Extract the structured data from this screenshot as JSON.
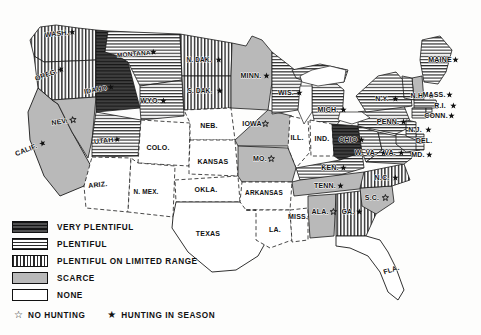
{
  "map": {
    "title": "United States game distribution map",
    "states": [
      {
        "code": "WASH",
        "label": "WASH.",
        "fill": "limited",
        "star": "season",
        "x": 57,
        "y": 36,
        "rot": -6
      },
      {
        "code": "OREG",
        "label": "OREG.",
        "fill": "limited",
        "star": "season",
        "x": 47,
        "y": 77,
        "rot": -20
      },
      {
        "code": "IDAHO",
        "label": "IDAHO",
        "fill": "very",
        "star": "season",
        "x": 96,
        "y": 92,
        "rot": -10
      },
      {
        "code": "MONT",
        "label": "MONTANA",
        "fill": "plentiful",
        "star": "season",
        "x": 134,
        "y": 56,
        "rot": -5
      },
      {
        "code": "WYO",
        "label": "WYO.",
        "fill": "plentiful",
        "star": "season",
        "x": 150,
        "y": 103,
        "rot": 0
      },
      {
        "code": "NDAK",
        "label": "N. DAK.",
        "fill": "limited",
        "star": "season",
        "x": 199,
        "y": 62,
        "rot": 0
      },
      {
        "code": "SDAK",
        "label": "S. DAK.",
        "fill": "limited",
        "star": "season",
        "x": 200,
        "y": 93,
        "rot": 0
      },
      {
        "code": "MINN",
        "label": "MINN.",
        "fill": "scarce",
        "star": "season",
        "x": 251,
        "y": 78,
        "rot": 0
      },
      {
        "code": "WIS",
        "label": "WIS.",
        "fill": "plentiful",
        "star": "season",
        "x": 286,
        "y": 95,
        "rot": 0
      },
      {
        "code": "MICH",
        "label": "MICH.",
        "fill": "plentiful",
        "star": "season",
        "x": 328,
        "y": 112,
        "rot": 0
      },
      {
        "code": "IOWA",
        "label": "IOWA",
        "fill": "scarce",
        "star": "none",
        "x": 252,
        "y": 126,
        "rot": 0
      },
      {
        "code": "NEB",
        "label": "NEB.",
        "fill": "none",
        "star": "",
        "x": 209,
        "y": 128,
        "rot": 0
      },
      {
        "code": "NEV",
        "label": "NEV.",
        "fill": "scarce",
        "star": "none",
        "x": 60,
        "y": 124,
        "rot": -8
      },
      {
        "code": "CALIF",
        "label": "CALIF.",
        "fill": "scarce",
        "star": "season",
        "x": 27,
        "y": 152,
        "rot": -22
      },
      {
        "code": "UTAH",
        "label": "UTAH",
        "fill": "plentiful",
        "star": "season",
        "x": 104,
        "y": 143,
        "rot": -6
      },
      {
        "code": "COLO",
        "label": "COLO.",
        "fill": "none",
        "star": "",
        "x": 158,
        "y": 150,
        "rot": 0
      },
      {
        "code": "KANSAS",
        "label": "KANSAS",
        "fill": "none",
        "star": "",
        "x": 213,
        "y": 164,
        "rot": 0
      },
      {
        "code": "ARIZ",
        "label": "ARIZ.",
        "fill": "none",
        "star": "",
        "x": 98,
        "y": 187,
        "rot": -6
      },
      {
        "code": "NMEX",
        "label": "N. MEX.",
        "fill": "none",
        "star": "",
        "x": 146,
        "y": 194,
        "rot": 0
      },
      {
        "code": "OKLA",
        "label": "OKLA.",
        "fill": "none",
        "star": "",
        "x": 206,
        "y": 192,
        "rot": 0
      },
      {
        "code": "TEXAS",
        "label": "TEXAS",
        "fill": "none",
        "star": "",
        "x": 208,
        "y": 236,
        "rot": 0
      },
      {
        "code": "MO",
        "label": "MO.",
        "fill": "scarce",
        "star": "none",
        "x": 260,
        "y": 161,
        "rot": 0
      },
      {
        "code": "ARK",
        "label": "ARKANSAS",
        "fill": "none",
        "star": "",
        "x": 264,
        "y": 195,
        "rot": 0
      },
      {
        "code": "LA",
        "label": "LA.",
        "fill": "none",
        "star": "",
        "x": 275,
        "y": 232,
        "rot": 0
      },
      {
        "code": "MISS",
        "label": "MISS.",
        "fill": "none",
        "star": "",
        "x": 298,
        "y": 219,
        "rot": 0
      },
      {
        "code": "ILL",
        "label": "ILL.",
        "fill": "none",
        "star": "",
        "x": 297,
        "y": 140,
        "rot": 0
      },
      {
        "code": "IND",
        "label": "IND.",
        "fill": "none",
        "star": "",
        "x": 322,
        "y": 141,
        "rot": 0
      },
      {
        "code": "OHIO",
        "label": "OHIO",
        "fill": "very",
        "star": "season",
        "x": 348,
        "y": 142,
        "rot": 0
      },
      {
        "code": "KEN",
        "label": "KEN.",
        "fill": "plentiful",
        "star": "season",
        "x": 330,
        "y": 170,
        "rot": 0
      },
      {
        "code": "TENN",
        "label": "TENN.",
        "fill": "scarce",
        "star": "season",
        "x": 325,
        "y": 188,
        "rot": 0
      },
      {
        "code": "ALA",
        "label": "ALA.",
        "fill": "scarce",
        "star": "none",
        "x": 320,
        "y": 214,
        "rot": 0
      },
      {
        "code": "GA",
        "label": "GA.",
        "fill": "limited",
        "star": "season",
        "x": 348,
        "y": 214,
        "rot": 0
      },
      {
        "code": "SC",
        "label": "S.C.",
        "fill": "scarce",
        "star": "none",
        "x": 372,
        "y": 200,
        "rot": 0
      },
      {
        "code": "NC",
        "label": "N.C.",
        "fill": "limited",
        "star": "season",
        "x": 382,
        "y": 180,
        "rot": 0
      },
      {
        "code": "WVA",
        "label": "W. VA.",
        "fill": "plentiful",
        "star": "season",
        "x": 366,
        "y": 155,
        "rot": 0
      },
      {
        "code": "VA",
        "label": "VA.",
        "fill": "plentiful",
        "star": "season",
        "x": 390,
        "y": 155,
        "rot": 0
      },
      {
        "code": "MD",
        "label": "MD.",
        "fill": "plentiful",
        "star": "season",
        "x": 418,
        "y": 157,
        "rot": 0
      },
      {
        "code": "DEL",
        "label": "DEL.",
        "fill": "plentiful",
        "star": "",
        "x": 424,
        "y": 143,
        "rot": 0
      },
      {
        "code": "PENN",
        "label": "PENN.",
        "fill": "plentiful",
        "star": "season",
        "x": 388,
        "y": 124,
        "rot": 0
      },
      {
        "code": "NJ",
        "label": "N.J.",
        "fill": "plentiful",
        "star": "season",
        "x": 415,
        "y": 132,
        "rot": 0
      },
      {
        "code": "NY",
        "label": "N.Y.",
        "fill": "plentiful",
        "star": "season",
        "x": 382,
        "y": 101,
        "rot": 0
      },
      {
        "code": "NH",
        "label": "N.H.",
        "fill": "scarce",
        "star": "season",
        "x": 418,
        "y": 98,
        "rot": 0
      },
      {
        "code": "MASS",
        "label": "MASS.",
        "fill": "plentiful",
        "star": "season",
        "x": 434,
        "y": 97,
        "rot": 0
      },
      {
        "code": "RI",
        "label": "R.I.",
        "fill": "plentiful",
        "star": "season",
        "x": 440,
        "y": 108,
        "rot": 0
      },
      {
        "code": "CONN",
        "label": "CONN.",
        "fill": "plentiful",
        "star": "season",
        "x": 436,
        "y": 118,
        "rot": 0
      },
      {
        "code": "MAINE",
        "label": "MAINE",
        "fill": "plentiful",
        "star": "season",
        "x": 440,
        "y": 62,
        "rot": 0
      },
      {
        "code": "FLA",
        "label": "FLA.",
        "fill": "none",
        "star": "",
        "x": 392,
        "y": 272,
        "rot": -18
      }
    ]
  },
  "legend": {
    "items": [
      {
        "key": "very",
        "label": "VERY PLENTIFUL"
      },
      {
        "key": "plentiful",
        "label": "PLENTIFUL"
      },
      {
        "key": "limited",
        "label": "PLENTIFUL ON LIMITED RANGE"
      },
      {
        "key": "scarce",
        "label": "SCARCE"
      },
      {
        "key": "none",
        "label": "NONE"
      }
    ],
    "symbols": [
      {
        "key": "no-hunting",
        "glyph": "☆",
        "label": "NO HUNTING"
      },
      {
        "key": "hunting-in-season",
        "glyph": "★",
        "label": "HUNTING IN SEASON"
      }
    ]
  },
  "colors": {
    "very_plentiful": "#4a4a4a",
    "scarce": "#b9b9b9",
    "none": "#ffffff",
    "ink": "#111111"
  }
}
